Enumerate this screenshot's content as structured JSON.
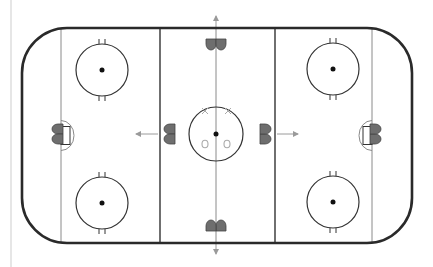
{
  "diagram": {
    "type": "ice-hockey-rink",
    "colors": {
      "board": "#2a2a2a",
      "line": "#333333",
      "thin_line": "#8a8a8a",
      "player_fill": "#6e6e6e",
      "player_stroke": "#444444",
      "arrow": "#9a9a9a",
      "marker_light": "#aaaaaa",
      "dot": "#111111",
      "left_edge": "#e6e6e6"
    },
    "rink": {
      "x": 22,
      "y": 28,
      "width": 390,
      "height": 215,
      "corner_radius": 45
    },
    "lines": {
      "goal_line_left_x": 61,
      "blue_line_left_x": 160,
      "center_line_x": 216,
      "blue_line_right_x": 275,
      "goal_line_right_x": 372
    },
    "faceoff_circles": [
      {
        "name": "left-top",
        "cx": 102,
        "cy": 70,
        "r": 26
      },
      {
        "name": "left-bottom",
        "cx": 102,
        "cy": 203,
        "r": 26
      },
      {
        "name": "right-top",
        "cx": 333,
        "cy": 69,
        "r": 26
      },
      {
        "name": "right-bottom",
        "cx": 333,
        "cy": 202,
        "r": 26
      },
      {
        "name": "center",
        "cx": 216,
        "cy": 134,
        "r": 27
      }
    ],
    "players": [
      {
        "name": "player-top-center",
        "x": 216,
        "y": 44,
        "facing": "down"
      },
      {
        "name": "player-bottom-center",
        "x": 216,
        "y": 226,
        "facing": "up"
      },
      {
        "name": "player-left-blue",
        "x": 170,
        "y": 134,
        "facing": "left"
      },
      {
        "name": "player-right-blue",
        "x": 265,
        "y": 134,
        "facing": "right"
      },
      {
        "name": "player-left-goalie",
        "x": 58,
        "y": 134,
        "facing": "left"
      },
      {
        "name": "player-right-goalie",
        "x": 375,
        "y": 134,
        "facing": "right"
      }
    ],
    "arrows": [
      {
        "name": "arrow-up",
        "x1": 216,
        "y1": 28,
        "x2": 216,
        "y2": 16
      },
      {
        "name": "arrow-down",
        "x1": 216,
        "y1": 243,
        "x2": 216,
        "y2": 254
      },
      {
        "name": "arrow-left",
        "x1": 158,
        "y1": 134,
        "x2": 136,
        "y2": 134
      },
      {
        "name": "arrow-right",
        "x1": 277,
        "y1": 134,
        "x2": 298,
        "y2": 134
      }
    ],
    "center_markers": {
      "x_marks": [
        {
          "x": 205,
          "y": 111
        },
        {
          "x": 228,
          "y": 111
        }
      ],
      "o_marks": [
        {
          "x": 205,
          "y": 144
        },
        {
          "x": 227,
          "y": 144
        }
      ]
    }
  }
}
